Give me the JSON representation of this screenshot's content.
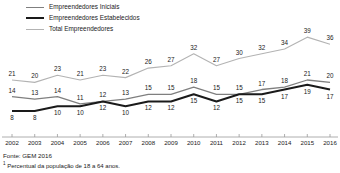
{
  "legend": {
    "position": "top-left",
    "items": [
      {
        "label": "Empreendedores Iniciais",
        "color": "#7f7f7f",
        "key": "iniciais"
      },
      {
        "label": "Empreendedores Estabelecidos",
        "color": "#1a1a1a",
        "key": "estabelecidos"
      },
      {
        "label": "Total Empreendedores",
        "color": "#b3b3b3",
        "key": "total"
      }
    ]
  },
  "footer": {
    "source": "Fonte: GEM 2016",
    "note_marker": "1",
    "note": " Percentual da população de 18 a 64 anos."
  },
  "chart_data": {
    "type": "line",
    "title": "",
    "subtitle": "",
    "xlabel": "",
    "ylabel": "",
    "grid": false,
    "legend_position": "top-left",
    "data_labels": true,
    "categories": [
      "2002",
      "2003",
      "2004",
      "2005",
      "2006",
      "2007",
      "2008",
      "2009",
      "2010",
      "2011",
      "2012",
      "2013",
      "2014",
      "2015",
      "2016"
    ],
    "x": [
      2002,
      2003,
      2004,
      2005,
      2006,
      2007,
      2008,
      2009,
      2010,
      2011,
      2012,
      2013,
      2014,
      2015,
      2016
    ],
    "ylim": [
      0,
      42
    ],
    "xlim": [
      2002,
      2016
    ],
    "series": [
      {
        "name": "Total Empreendedores",
        "color": "#b3b3b3",
        "values": [
          21,
          20,
          23,
          21,
          23,
          22,
          26,
          27,
          32,
          27,
          30,
          32,
          34,
          39,
          36
        ]
      },
      {
        "name": "Empreendedores Iniciais",
        "color": "#7f7f7f",
        "values": [
          14,
          13,
          14,
          11,
          12,
          13,
          15,
          15,
          18,
          15,
          15,
          17,
          18,
          21,
          20
        ]
      },
      {
        "name": "Empreendedores Estabelecidos",
        "color": "#1a1a1a",
        "values": [
          8,
          8,
          10,
          10,
          12,
          10,
          12,
          12,
          15,
          12,
          15,
          15,
          17,
          19,
          17
        ]
      }
    ]
  }
}
